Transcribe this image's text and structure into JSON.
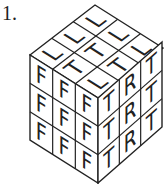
{
  "question_number": "1.",
  "cube": {
    "top_face": [
      [
        "L",
        "L",
        "L"
      ],
      [
        "T",
        "T",
        "L"
      ],
      [
        "L",
        "T",
        "L"
      ]
    ],
    "left_face": [
      [
        "F",
        "F",
        "F"
      ],
      [
        "F",
        "F",
        "F"
      ],
      [
        "F",
        "F",
        "F"
      ]
    ],
    "right_face": [
      [
        "T",
        "R",
        "T"
      ],
      [
        "T",
        "R",
        "T"
      ],
      [
        "T",
        "R",
        "T"
      ]
    ]
  },
  "colors": {
    "line": "#222222",
    "background": "#ffffff"
  }
}
